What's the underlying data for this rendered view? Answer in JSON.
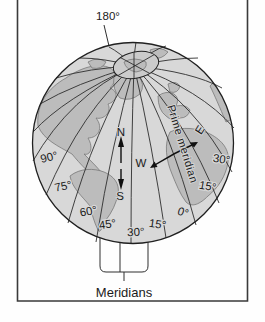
{
  "diagram": {
    "top_label": "180°",
    "prime_meridian_label": "Prime meridian",
    "caption": "Meridians",
    "compass": {
      "n": "N",
      "s": "S",
      "w": "W",
      "e": "E"
    },
    "longitude_labels": {
      "left": [
        "90°",
        "75°",
        "60°"
      ],
      "bottom": [
        "45°",
        "30°",
        "15°",
        "0°"
      ],
      "right": [
        "15°",
        "30°"
      ]
    }
  },
  "colors": {
    "background": "#fefefe",
    "frame": "#3a3a3a",
    "ocean": "#d8d8d8",
    "pole_cap": "#cbcbcb",
    "land": "#bcbcbc",
    "land_outline": "#787878",
    "meridian_line": "#2e2e2e",
    "text": "#1b1b1b"
  }
}
